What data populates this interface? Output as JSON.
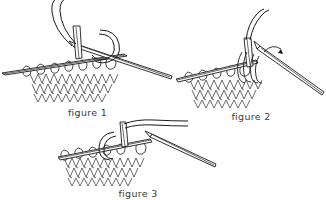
{
  "document": {
    "kind": "line-art-instructional-diagram",
    "subject": "knitting stitch technique",
    "background_color": "#ffffff",
    "ink_color": "#1a1a1a",
    "caption_color": "#3b3b3b"
  },
  "figures": [
    {
      "id": "figure-1",
      "caption": "figure 1",
      "art_name": "knitting-needles-stitches-illustration-1",
      "elements": {
        "yarn_strand": "loose working yarn curving up from needle tip",
        "right_needle": "knitting needle angled down to the right",
        "left_needle": "knitting needle holding row of stitches",
        "stitch_row": "row of cast-on loops on left needle",
        "fabric": "knitted stockinette fabric with V-shaped stitches"
      }
    },
    {
      "id": "figure-2",
      "caption": "figure 2",
      "art_name": "knitting-needles-stitches-illustration-2",
      "elements": {
        "yarn_strand": "working yarn rising from needle tips",
        "right_needle": "knitting needle angled down to the right",
        "left_needle": "knitting needle holding row of stitches",
        "stitch_row": "row of loops on left needle",
        "fabric": "knitted stockinette fabric with V-shaped stitches",
        "arrow": "curved motion arrow indicating yarn direction"
      }
    },
    {
      "id": "figure-3",
      "caption": "figure 3",
      "caption_clipped": true,
      "art_name": "knitting-needles-stitches-illustration-3",
      "elements": {
        "yarn_strand": "working yarn extending to the right",
        "right_needle": "knitting needle angled down to the right",
        "left_needle": "knitting needle holding row of stitches",
        "stitch_row": "row of loops with large pulled-through loop",
        "fabric": "knitted stockinette fabric with V-shaped stitches"
      }
    }
  ]
}
